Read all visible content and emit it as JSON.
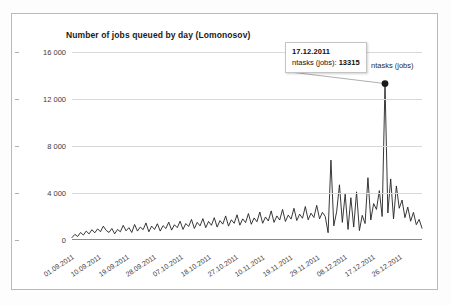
{
  "chart_data": {
    "type": "line",
    "title": "Number of jobs queued by day (Lomonosov)",
    "xlabel": "",
    "ylabel": "",
    "ylim": [
      0,
      16000
    ],
    "grid": true,
    "legend_position": "top-right",
    "legend": [
      "ntasks (jobs)"
    ],
    "y_ticks": [
      "0",
      "4 000",
      "8 000",
      "12 000",
      "16 000"
    ],
    "y_tick_values": [
      0,
      4000,
      8000,
      12000,
      16000
    ],
    "x_ticks": [
      "01.09.2011",
      "10.09.2011",
      "19.09.2011",
      "28.09.2011",
      "07.10.2011",
      "18.10.2011",
      "27.10.2011",
      "10.11.2011",
      "19.11.2011",
      "29.11.2011",
      "08.12.2011",
      "17.12.2011",
      "26.12.2011"
    ],
    "series": [
      {
        "name": "ntasks (jobs)",
        "color": "#222222",
        "values": [
          210,
          480,
          300,
          640,
          420,
          760,
          520,
          880,
          610,
          950,
          700,
          1180,
          820,
          640,
          980,
          520,
          900,
          700,
          1250,
          780,
          1050,
          640,
          1320,
          760,
          1100,
          880,
          1450,
          700,
          1180,
          900,
          1380,
          760,
          1220,
          980,
          1520,
          840,
          1300,
          1050,
          1600,
          900,
          1400,
          1150,
          1750,
          980,
          1500,
          1200,
          1820,
          1050,
          1580,
          1250,
          1900,
          1100,
          1650,
          1350,
          2050,
          1180,
          1720,
          1420,
          2150,
          1260,
          1800,
          1480,
          2250,
          1340,
          1880,
          1550,
          2380,
          1420,
          1960,
          1620,
          2480,
          1500,
          2050,
          1700,
          2600,
          1580,
          2120,
          1780,
          2700,
          1660,
          2200,
          1850,
          2850,
          1720,
          2280,
          1920,
          2950,
          1800,
          2350,
          2000,
          620,
          6800,
          1200,
          2400,
          4700,
          1500,
          3900,
          900,
          3600,
          1100,
          4100,
          800,
          2100,
          1400,
          5300,
          1700,
          3100,
          2600,
          4200,
          2000,
          13315,
          2300,
          5200,
          1800,
          4600,
          2700,
          3400,
          1900,
          2800,
          1600,
          2350,
          1300,
          1750,
          1000
        ]
      }
    ],
    "annotation": {
      "date": "17.12.2011",
      "metric_label": "ntasks (jobs):",
      "value": "13315"
    }
  },
  "legend": {
    "label": "ntasks (jobs)"
  },
  "tooltip": {
    "date": "17.12.2011",
    "metric_label": "ntasks (jobs):",
    "value": "13315"
  }
}
